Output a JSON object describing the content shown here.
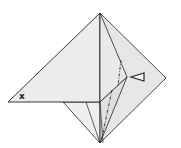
{
  "diagram": {
    "type": "origami-fold-step",
    "labels": {
      "corner_mark": "x"
    },
    "colors": {
      "paper": "#ececec",
      "paper_shade": "#e2e2e2",
      "line": "#222222",
      "background": "#ffffff"
    },
    "symbols": [
      "valley-fold-line",
      "mountain-fold-line",
      "push-arrow"
    ]
  }
}
